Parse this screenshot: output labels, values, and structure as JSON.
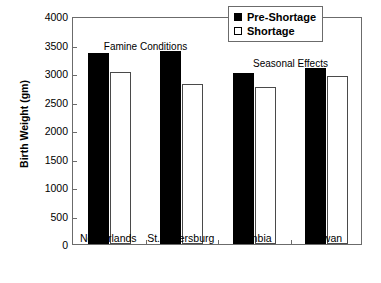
{
  "chart_data": {
    "type": "bar",
    "title": "",
    "xlabel": "",
    "ylabel": "Birth Weight (gm)",
    "categories": [
      "Netherlands",
      "St. Petersburg",
      "Gambia",
      "Taiwan"
    ],
    "series": [
      {
        "name": "Pre-Shortage",
        "color": "#000000",
        "values": [
          3350,
          3390,
          3000,
          3080
        ]
      },
      {
        "name": "Shortage",
        "color": "#ffffff",
        "values": [
          3020,
          2800,
          2750,
          2950
        ]
      }
    ],
    "ylim": [
      0,
      4000
    ],
    "yticks": [
      0,
      500,
      1000,
      1500,
      2000,
      2500,
      3000,
      3500,
      4000
    ],
    "ytick_labels": [
      "0",
      "500",
      "1000",
      "1500",
      "2000",
      "2500",
      "3000",
      "3500",
      "4000"
    ],
    "grid": false,
    "legend_position": "top-right",
    "annotations": [
      {
        "text": "Famine Conditions",
        "x_category_span": [
          0,
          1
        ],
        "value": 3600
      },
      {
        "text": "Seasonal Effects",
        "x_category_span": [
          2,
          3
        ],
        "value": 3300
      }
    ]
  },
  "legend": {
    "items": [
      {
        "label": "Pre-Shortage",
        "style": "dark"
      },
      {
        "label": "Shortage",
        "style": "light"
      }
    ]
  }
}
